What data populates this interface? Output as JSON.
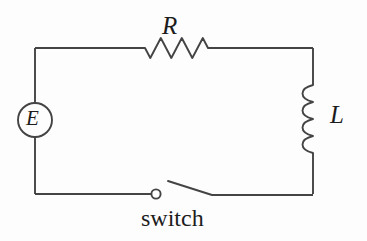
{
  "diagram": {
    "type": "circuit-schematic",
    "background_color": "#fdfdfd",
    "line_color": "#444444",
    "text_color": "#1c1c1c",
    "labels": {
      "resistor": "R",
      "inductor": "L",
      "source": "E",
      "switch": "switch"
    },
    "components": [
      {
        "name": "emf-source",
        "symbol": "circle-with-letter",
        "label": "E",
        "position": "left-branch",
        "center_x": 35,
        "center_y": 120,
        "radius": 17
      },
      {
        "name": "resistor",
        "symbol": "zigzag",
        "label": "R",
        "position": "top-branch",
        "peaks": 3,
        "x_start": 145,
        "x_end": 208,
        "baseline_y": 48,
        "amplitude": 10
      },
      {
        "name": "inductor",
        "symbol": "coil",
        "label": "L",
        "position": "right-branch",
        "loops": 4,
        "y_start": 85,
        "y_end": 150,
        "axis_x": 313,
        "bulge_direction": "left"
      },
      {
        "name": "switch",
        "symbol": "open-knife-switch",
        "label": "switch",
        "position": "bottom-branch",
        "state": "open",
        "terminal_x": 156,
        "terminal_y": 194,
        "lever_from_x": 212,
        "lever_from_y": 195,
        "lever_to_x": 168,
        "lever_to_y": 181
      }
    ],
    "frame": {
      "left_x": 35,
      "right_x": 313,
      "top_y": 48,
      "bottom_y": 194
    }
  }
}
